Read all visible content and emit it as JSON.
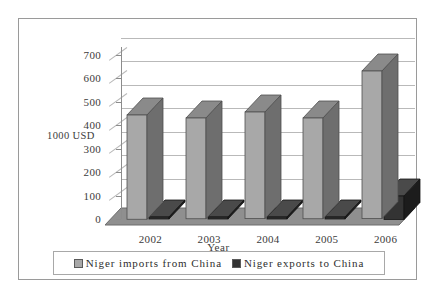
{
  "chart_data": {
    "type": "bar",
    "title": "",
    "subtitle": "",
    "xlabel": "Year",
    "ylabel": "1000 USD",
    "categories": [
      "2002",
      "2003",
      "2004",
      "2005",
      "2006"
    ],
    "series": [
      {
        "name": "Niger imports from China",
        "values": [
          445,
          430,
          455,
          430,
          630
        ],
        "color": "#a8a8a8",
        "side_color": "#6e6e6e",
        "top_color": "#8a8a8a"
      },
      {
        "name": "Niger exports to China",
        "values": [
          5,
          5,
          5,
          5,
          100
        ],
        "color": "#333333",
        "side_color": "#1c1c1c",
        "top_color": "#4a4a4a"
      }
    ],
    "ylim": [
      0,
      700
    ],
    "yticks": [
      "0",
      "100",
      "200",
      "300",
      "400",
      "500",
      "600",
      "700"
    ],
    "ytick_values": [
      0,
      100,
      200,
      300,
      400,
      500,
      600,
      700
    ],
    "grid": true,
    "legend_position": "bottom",
    "style": "3d-column"
  },
  "legend": {
    "entries": [
      {
        "label": "Niger imports from China",
        "swatch_color": "#a8a8a8"
      },
      {
        "label": "Niger exports to China",
        "swatch_color": "#333333"
      }
    ]
  },
  "colors": {
    "frame": "#9a9a9a",
    "gridline": "#b9b9b9",
    "axis": "#8c8c8c",
    "floor": "#8f8f8f",
    "text": "#3b3b3b",
    "background": "#ffffff"
  }
}
